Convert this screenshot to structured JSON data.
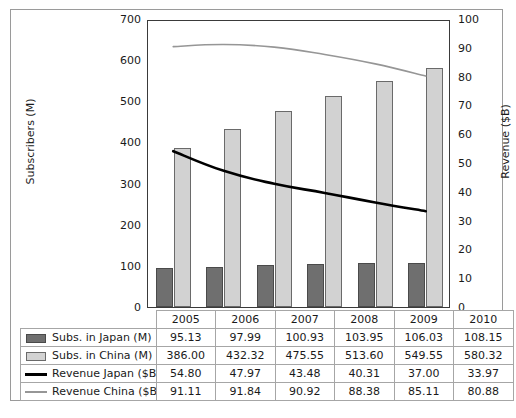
{
  "chart_data": {
    "type": "bar",
    "title": "",
    "categories": [
      "2005",
      "2006",
      "2007",
      "2008",
      "2009",
      "2010"
    ],
    "xlabel": "",
    "ylabel": "Subscribers (M)",
    "ylabel_secondary": "Revenue ($B)",
    "ylim": [
      0,
      700
    ],
    "ylim_secondary": [
      0,
      100
    ],
    "yticks": [
      0,
      100,
      200,
      300,
      400,
      500,
      600,
      700
    ],
    "yticks_secondary": [
      0,
      10,
      20,
      30,
      40,
      50,
      60,
      70,
      80,
      90,
      100
    ],
    "grid": false,
    "legend_position": "table-below",
    "series": [
      {
        "name": "Subs. in Japan (M)",
        "type": "bar",
        "axis": "left",
        "color": "#6f6f6f",
        "values": [
          95.13,
          97.99,
          100.93,
          103.95,
          106.03,
          108.15
        ],
        "labels": [
          "95.13",
          "97.99",
          "100.93",
          "103.95",
          "106.03",
          "108.15"
        ]
      },
      {
        "name": "Subs. in China (M)",
        "type": "bar",
        "axis": "left",
        "color": "#d2d2d2",
        "values": [
          386.0,
          432.32,
          475.55,
          513.6,
          549.55,
          580.32
        ],
        "labels": [
          "386.00",
          "432.32",
          "475.55",
          "513.60",
          "549.55",
          "580.32"
        ]
      },
      {
        "name": "Revenue Japan ($B)",
        "type": "line",
        "axis": "right",
        "color": "#000000",
        "values": [
          54.8,
          47.97,
          43.48,
          40.31,
          37.0,
          33.97
        ],
        "labels": [
          "54.80",
          "47.97",
          "43.48",
          "40.31",
          "37.00",
          "33.97"
        ]
      },
      {
        "name": "Revenue China ($B)",
        "type": "line",
        "axis": "right",
        "color": "#969696",
        "values": [
          91.11,
          91.84,
          90.92,
          88.38,
          85.11,
          80.88
        ],
        "labels": [
          "91.11",
          "91.84",
          "90.92",
          "88.38",
          "85.11",
          "80.88"
        ]
      }
    ]
  },
  "axes": {
    "left_title": "Subscribers (M)",
    "right_title": "Revenue ($B)",
    "left_ticks": [
      "700",
      "600",
      "500",
      "400",
      "300",
      "200",
      "100",
      "0"
    ],
    "right_ticks": [
      "100",
      "90",
      "80",
      "70",
      "60",
      "50",
      "40",
      "30",
      "20",
      "10",
      "0"
    ]
  },
  "table": {
    "year_headers": [
      "2005",
      "2006",
      "2007",
      "2008",
      "2009",
      "2010"
    ],
    "rows": [
      {
        "label": "Subs. in Japan (M)",
        "marker": "filled-dark-box",
        "values": [
          "95.13",
          "97.99",
          "100.93",
          "103.95",
          "106.03",
          "108.15"
        ]
      },
      {
        "label": "Subs. in China (M)",
        "marker": "filled-light-box",
        "values": [
          "386.00",
          "432.32",
          "475.55",
          "513.60",
          "549.55",
          "580.32"
        ]
      },
      {
        "label": "Revenue Japan ($B)",
        "marker": "thick-black-line",
        "values": [
          "54.80",
          "47.97",
          "43.48",
          "40.31",
          "37.00",
          "33.97"
        ]
      },
      {
        "label": "Revenue China ($B)",
        "marker": "thin-gray-line",
        "values": [
          "91.11",
          "91.84",
          "90.92",
          "88.38",
          "85.11",
          "80.88"
        ]
      }
    ]
  },
  "colors": {
    "japan_bar": "#6f6f6f",
    "china_bar": "#d2d2d2",
    "japan_line": "#000000",
    "china_line": "#969696",
    "frame": "#9a9a9a",
    "axis": "#3a3a3a",
    "background": "#ffffff"
  }
}
